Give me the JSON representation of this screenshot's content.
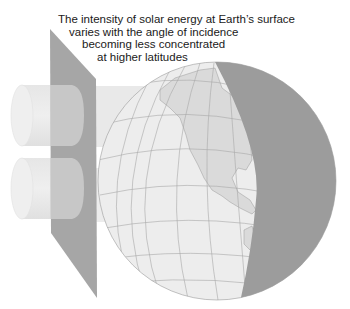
{
  "caption": {
    "lines": [
      "The intensity of solar energy at Earth’s surface",
      "varies with the angle of incidence",
      "becoming less concentrated",
      "at higher latitudes"
    ]
  },
  "diagram": {
    "elements": [
      "light-beam-upper",
      "light-beam-lower",
      "incidence-panel",
      "earth-globe",
      "night-hemisphere",
      "north-america-landmass",
      "graticule"
    ],
    "colors": {
      "panel": "#a6a6a6",
      "beam": "#e2e2e2",
      "globe_lit_ocean": "#ededed",
      "globe_land": "#dadada",
      "globe_night": "#9c9c9c",
      "graticule": "#a8a8a8",
      "text": "#1a1a1a"
    }
  }
}
